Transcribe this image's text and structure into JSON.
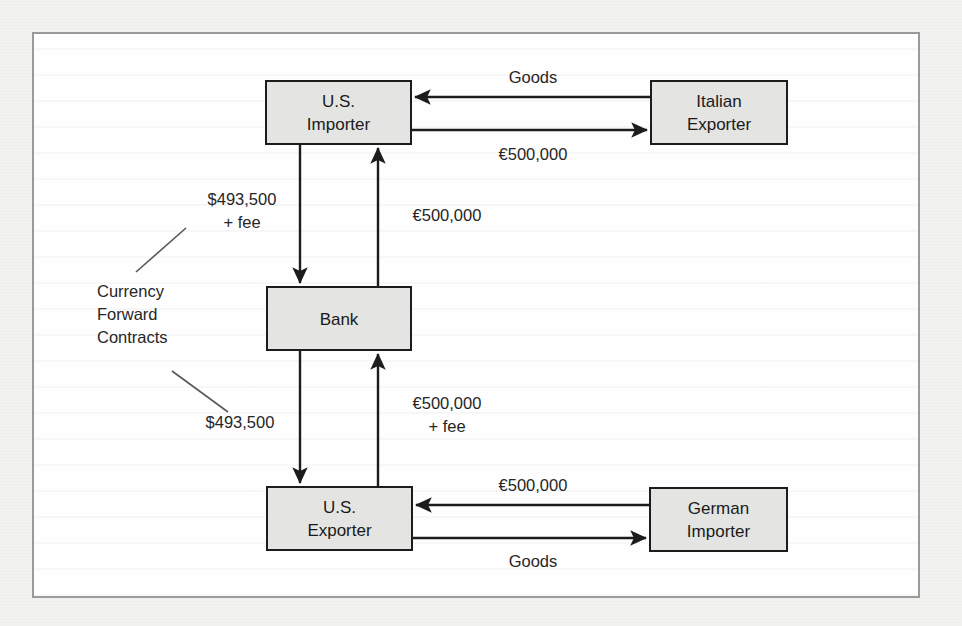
{
  "figure": {
    "background_color": "#f2f2f0",
    "panel_color": "#fefefe",
    "frame_color": "#9a9a98",
    "node_fill": "#e4e4e2",
    "line_color": "#1c1c1c",
    "text_color": "#262626"
  },
  "diagram": {
    "type": "flow-diagram",
    "nodes": [
      {
        "id": "us_importer",
        "line1": "U.S.",
        "line2": "Importer"
      },
      {
        "id": "italian_exporter",
        "line1": "Italian",
        "line2": "Exporter"
      },
      {
        "id": "bank",
        "line1": "Bank",
        "line2": ""
      },
      {
        "id": "us_exporter",
        "line1": "U.S.",
        "line2": "Exporter"
      },
      {
        "id": "german_importer",
        "line1": "German",
        "line2": "Importer"
      }
    ],
    "edges": [
      {
        "id": "goods_to_us_importer",
        "label": "Goods",
        "from": "italian_exporter",
        "to": "us_importer",
        "direction": "left"
      },
      {
        "id": "euros_to_italian",
        "label": "€500,000",
        "from": "us_importer",
        "to": "italian_exporter",
        "direction": "right"
      },
      {
        "id": "dollars_importer_bank",
        "label_line1": "$493,500",
        "label_line2": "+ fee",
        "from": "us_importer",
        "to": "bank",
        "direction": "down"
      },
      {
        "id": "euros_bank_importer",
        "label": "€500,000",
        "from": "bank",
        "to": "us_importer",
        "direction": "up"
      },
      {
        "id": "dollars_bank_exporter",
        "label": "$493,500",
        "from": "bank",
        "to": "us_exporter",
        "direction": "down"
      },
      {
        "id": "euros_exporter_bank",
        "label_line1": "€500,000",
        "label_line2": "+ fee",
        "from": "us_exporter",
        "to": "bank",
        "direction": "up"
      },
      {
        "id": "euros_to_us_exporter",
        "label": "€500,000",
        "from": "german_importer",
        "to": "us_exporter",
        "direction": "left"
      },
      {
        "id": "goods_to_german",
        "label": "Goods",
        "from": "us_exporter",
        "to": "german_importer",
        "direction": "right"
      }
    ],
    "annotation": {
      "id": "currency_forward_contracts",
      "line1": "Currency",
      "line2": "Forward",
      "line3": "Contracts",
      "points_to": [
        "dollars_importer_bank",
        "dollars_bank_exporter"
      ]
    }
  }
}
